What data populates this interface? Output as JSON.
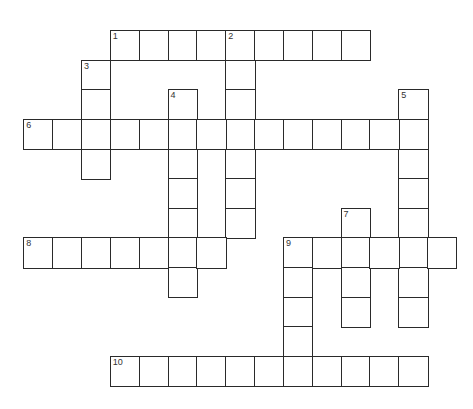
{
  "puzzle": {
    "type": "crossword",
    "grid": {
      "origin_x": 24,
      "origin_y": 31,
      "cell_w": 28.85,
      "cell_h": 29.6,
      "line_color": "#2a2a2a"
    },
    "entries": [
      {
        "number": "1",
        "direction": "across",
        "row": 0,
        "col": 3,
        "length": 9
      },
      {
        "number": "2",
        "direction": "down",
        "row": 0,
        "col": 7,
        "length": 7
      },
      {
        "number": "3",
        "direction": "down",
        "row": 1,
        "col": 2,
        "length": 4
      },
      {
        "number": "4",
        "direction": "down",
        "row": 2,
        "col": 5,
        "length": 7
      },
      {
        "number": "5",
        "direction": "down",
        "row": 2,
        "col": 13,
        "length": 8
      },
      {
        "number": "6",
        "direction": "across",
        "row": 3,
        "col": 0,
        "length": 14
      },
      {
        "number": "7",
        "direction": "down",
        "row": 6,
        "col": 11,
        "length": 4
      },
      {
        "number": "8",
        "direction": "across",
        "row": 7,
        "col": 0,
        "length": 7
      },
      {
        "number": "9",
        "direction": "across",
        "row": 7,
        "col": 9,
        "length": 6
      },
      {
        "number": "9",
        "direction": "down",
        "row": 7,
        "col": 9,
        "length": 5
      },
      {
        "number": "10",
        "direction": "across",
        "row": 11,
        "col": 3,
        "length": 11
      }
    ],
    "numbered_cells": [
      {
        "label": "1",
        "row": 0,
        "col": 3
      },
      {
        "label": "2",
        "row": 0,
        "col": 7
      },
      {
        "label": "3",
        "row": 1,
        "col": 2
      },
      {
        "label": "4",
        "row": 2,
        "col": 5
      },
      {
        "label": "5",
        "row": 2,
        "col": 13
      },
      {
        "label": "6",
        "row": 3,
        "col": 0
      },
      {
        "label": "7",
        "row": 6,
        "col": 11
      },
      {
        "label": "8",
        "row": 7,
        "col": 0
      },
      {
        "label": "9",
        "row": 7,
        "col": 9
      },
      {
        "label": "10",
        "row": 11,
        "col": 3
      }
    ]
  }
}
